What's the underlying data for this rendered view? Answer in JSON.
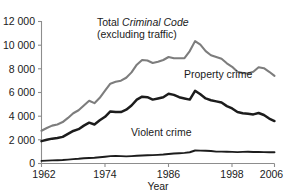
{
  "chart_data": {
    "type": "line",
    "title": "",
    "subtitle": "",
    "xlabel": "Year",
    "ylabel": "",
    "xlim": [
      1962,
      2006
    ],
    "ylim": [
      0,
      12000
    ],
    "grid": false,
    "legend_position": "inline-annotations",
    "x_ticks": [
      "1962",
      "1974",
      "1986",
      "1998",
      "2006"
    ],
    "x_tick_values": [
      1962,
      1974,
      1986,
      1998,
      2006
    ],
    "y_ticks": [
      "0",
      "2 000",
      "4 000",
      "6 000",
      "8 000",
      "10 000",
      "12 000"
    ],
    "y_tick_values": [
      0,
      2000,
      4000,
      6000,
      8000,
      10000,
      12000
    ],
    "x": [
      1962,
      1963,
      1964,
      1965,
      1966,
      1967,
      1968,
      1969,
      1970,
      1971,
      1972,
      1973,
      1974,
      1975,
      1976,
      1977,
      1978,
      1979,
      1980,
      1981,
      1982,
      1983,
      1984,
      1985,
      1986,
      1987,
      1988,
      1989,
      1990,
      1991,
      1992,
      1993,
      1994,
      1995,
      1996,
      1997,
      1998,
      1999,
      2000,
      2001,
      2002,
      2003,
      2004,
      2005,
      2006
    ],
    "series": [
      {
        "name": "Total Criminal Code (excluding traffic)",
        "color": "#7d7d7d",
        "values": [
          2771,
          3000,
          3200,
          3300,
          3500,
          3850,
          4250,
          4500,
          4900,
          5300,
          5100,
          5550,
          6150,
          6750,
          6900,
          7000,
          7250,
          7700,
          8350,
          8750,
          8700,
          8500,
          8600,
          8750,
          9000,
          8900,
          8900,
          8900,
          9500,
          10342,
          10040,
          9500,
          9150,
          9000,
          8850,
          8470,
          8175,
          7750,
          7650,
          7600,
          7750,
          8130,
          8050,
          7750,
          7400
        ]
      },
      {
        "name": "Property crime",
        "color": "#1c1c1c",
        "values": [
          1891,
          2000,
          2100,
          2150,
          2250,
          2500,
          2750,
          2900,
          3200,
          3450,
          3300,
          3650,
          3950,
          4400,
          4350,
          4350,
          4550,
          4900,
          5400,
          5650,
          5600,
          5400,
          5500,
          5600,
          5900,
          5800,
          5600,
          5500,
          5400,
          6142,
          5850,
          5500,
          5350,
          5250,
          5150,
          4850,
          4650,
          4350,
          4250,
          4200,
          4150,
          4270,
          4100,
          3800,
          3588
        ]
      },
      {
        "name": "Violent crime",
        "color": "#1c1c1c",
        "values": [
          221,
          240,
          260,
          280,
          300,
          330,
          370,
          400,
          440,
          470,
          490,
          530,
          570,
          620,
          640,
          620,
          600,
          620,
          650,
          680,
          700,
          710,
          730,
          760,
          800,
          840,
          870,
          900,
          950,
          1100,
          1090,
          1080,
          1060,
          1000,
          1000,
          990,
          980,
          960,
          980,
          990,
          970,
          970,
          960,
          950,
          951
        ]
      }
    ],
    "annotations": [
      {
        "id": "total",
        "text_line1_prefix": "Total ",
        "text_line1_italic": "Criminal Code",
        "text_line2": "(excluding traffic)"
      },
      {
        "id": "property",
        "text": "Property crime"
      },
      {
        "id": "violent",
        "text": "Violent crime"
      }
    ]
  },
  "axis": {
    "x_title": "Year",
    "y_tick_0": "0",
    "y_tick_1": "2 000",
    "y_tick_2": "4 000",
    "y_tick_3": "6 000",
    "y_tick_4": "8 000",
    "y_tick_5": "10 000",
    "y_tick_6": "12 000",
    "x_tick_0": "1962",
    "x_tick_1": "1974",
    "x_tick_2": "1986",
    "x_tick_3": "1998",
    "x_tick_4": "2006"
  },
  "labels": {
    "total_prefix": "Total ",
    "total_italic": "Criminal Code",
    "total_line2": "(excluding traffic)",
    "property": "Property crime",
    "violent": "Violent crime"
  }
}
